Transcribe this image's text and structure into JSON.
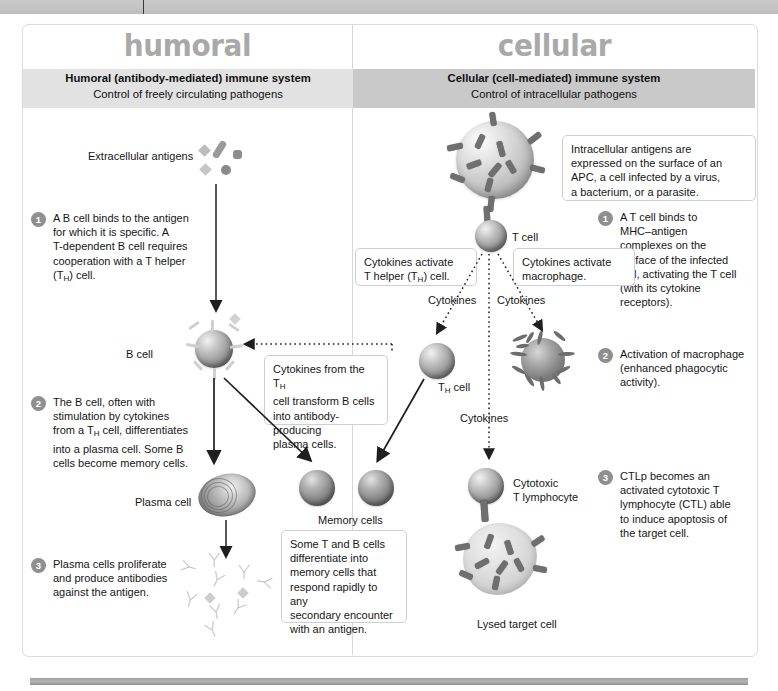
{
  "page": {
    "columns": [
      {
        "id": "humoral",
        "big_title": "humoral",
        "band_line1": "Humoral (antibody-mediated) immune system",
        "band_line2": "Control of freely circulating pathogens"
      },
      {
        "id": "cellular",
        "big_title": "cellular",
        "band_line1": "Cellular (cell-mediated) immune system",
        "band_line2": "Control of intracellular pathogens"
      }
    ]
  },
  "humoral": {
    "labels": {
      "extracellular_antigens": "Extracellular antigens",
      "b_cell": "B cell",
      "plasma_cell": "Plasma cell",
      "memory_cells": "Memory cells"
    },
    "steps": [
      {
        "number": "1",
        "text_lines": [
          "A B cell binds to the antigen",
          "for which it is specific. A",
          "T-dependent B cell requires",
          "cooperation with a T helper",
          "(TH) cell."
        ]
      },
      {
        "number": "2",
        "text_lines": [
          "The B cell, often with",
          "stimulation by cytokines",
          "from a TH cell, differentiates",
          "into a plasma cell. Some B",
          "cells become memory cells."
        ]
      },
      {
        "number": "3",
        "text_lines": [
          "Plasma cells proliferate",
          "and produce antibodies",
          "against the antigen."
        ]
      }
    ],
    "callouts": [
      {
        "id": "cytokines-transform-b-cells",
        "lines": [
          "Cytokines from the TH",
          "cell transform B cells",
          "into antibody-producing",
          "plasma cells."
        ]
      },
      {
        "id": "memory-cells-note",
        "lines": [
          "Some T and B cells",
          "differentiate into",
          "memory cells that",
          "respond rapidly to any",
          "secondary encounter",
          "with an antigen."
        ]
      }
    ]
  },
  "cellular": {
    "labels": {
      "t_cell": "T cell",
      "th_cell": "TH cell",
      "cytokines_left": "Cytokines",
      "cytokines_right": "Cytokines",
      "cytokines_lower": "Cytokines",
      "cytotoxic_t_lymphocyte_line1": "Cytotoxic",
      "cytotoxic_t_lymphocyte_line2": "T lymphocyte",
      "lysed_target_cell": "Lysed target cell"
    },
    "steps": [
      {
        "number": "1",
        "text_lines": [
          "A T cell binds to",
          "MHC–antigen",
          "complexes on the",
          "surface of the infected",
          "cell, activating the T cell",
          "(with its cytokine",
          "receptors)."
        ]
      },
      {
        "number": "2",
        "text_lines": [
          "Activation of macrophage",
          "(enhanced phagocytic",
          "activity)."
        ]
      },
      {
        "number": "3",
        "text_lines": [
          "CTLp becomes an",
          "activated cytotoxic T",
          "lymphocyte (CTL) able",
          "to induce apoptosis of",
          "the target cell."
        ]
      }
    ],
    "callouts": [
      {
        "id": "intracellular-antigens",
        "lines": [
          "Intracellular antigens are",
          "expressed on the surface of an",
          "APC, a cell infected by a virus,",
          "a bacterium, or a parasite."
        ]
      },
      {
        "id": "cytokines-activate-t-helper",
        "lines": [
          "Cytokines activate",
          "T helper (TH) cell."
        ]
      },
      {
        "id": "cytokines-activate-macrophage",
        "lines": [
          "Cytokines activate",
          "macrophage."
        ]
      }
    ]
  },
  "colors": {
    "band_left": "#e2e2e2",
    "band_right": "#c9c9c9",
    "big_title": "#a9a9a9",
    "badge": "#8f8f8f",
    "text": "#161616",
    "card_border": "#dcdcdc"
  }
}
